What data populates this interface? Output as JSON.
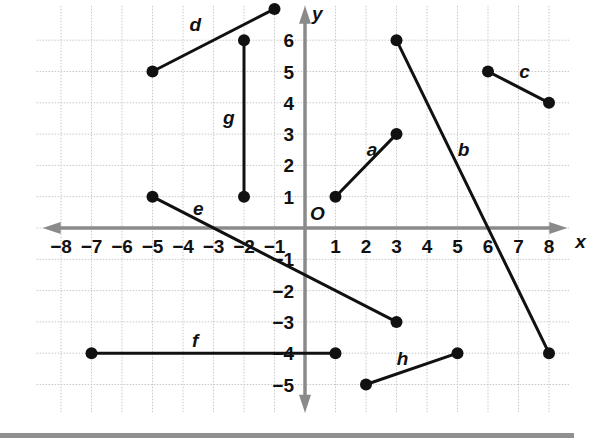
{
  "chart_data": {
    "type": "coordinate-plane",
    "title": "",
    "xlabel": "x",
    "ylabel": "y",
    "origin_label": "O",
    "xlim": [
      -8.5,
      8.5
    ],
    "ylim": [
      -5.8,
      7.2
    ],
    "grid": true,
    "x_ticks": [
      "-8",
      "-7",
      "-6",
      "-5",
      "-4",
      "-3",
      "-2",
      "-1",
      "1",
      "2",
      "3",
      "4",
      "5",
      "6",
      "7",
      "8"
    ],
    "y_ticks": [
      "6",
      "5",
      "4",
      "3",
      "2",
      "1",
      "-1",
      "-2",
      "-3",
      "-4",
      "-5"
    ],
    "segments": [
      {
        "name": "a",
        "from": [
          1,
          1
        ],
        "to": [
          3,
          3
        ]
      },
      {
        "name": "b",
        "from": [
          3,
          6
        ],
        "to": [
          8,
          -4
        ]
      },
      {
        "name": "c",
        "from": [
          6,
          5
        ],
        "to": [
          8,
          4
        ]
      },
      {
        "name": "d",
        "from": [
          -5,
          5
        ],
        "to": [
          -1,
          7
        ]
      },
      {
        "name": "e",
        "from": [
          -5,
          1
        ],
        "to": [
          3,
          -3
        ]
      },
      {
        "name": "f",
        "from": [
          -7,
          -4
        ],
        "to": [
          1,
          -4
        ]
      },
      {
        "name": "g",
        "from": [
          -2,
          6
        ],
        "to": [
          -2,
          1
        ]
      },
      {
        "name": "h",
        "from": [
          2,
          -5
        ],
        "to": [
          5,
          -4
        ]
      }
    ]
  },
  "axes": {
    "x_label": "x",
    "y_label": "y",
    "origin": "O"
  }
}
